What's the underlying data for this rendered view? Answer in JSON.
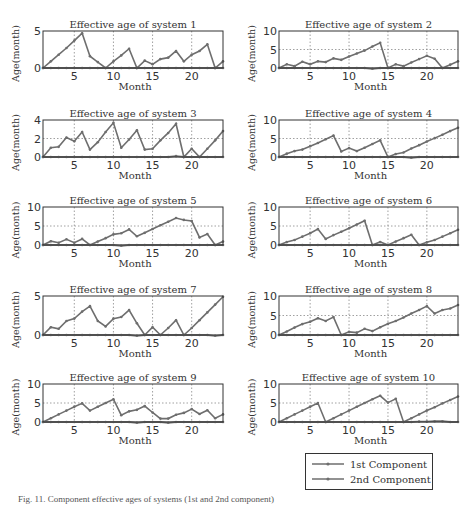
{
  "figure": {
    "caption": "Fig. 11. Component effective ages of systems (1st and 2nd component)"
  },
  "legend": {
    "items": [
      {
        "label": "1st Component",
        "color": "#6e6e6e"
      },
      {
        "label": "2nd Component",
        "color": "#6e6e6e"
      }
    ]
  },
  "chart_data": [
    {
      "type": "line",
      "title": "Effective age of system 1",
      "xlabel": "Month",
      "ylabel": "Age(month)",
      "xlim": [
        1,
        24
      ],
      "ylim": [
        0,
        5
      ],
      "yticks": [
        0,
        5
      ],
      "xticks": [
        5,
        10,
        15,
        20
      ],
      "grid": true,
      "x": [
        1,
        2,
        3,
        4,
        5,
        6,
        7,
        8,
        9,
        10,
        11,
        12,
        13,
        14,
        15,
        16,
        17,
        18,
        19,
        20,
        21,
        22,
        23,
        24
      ],
      "series": [
        {
          "name": "1st Component",
          "values": [
            0,
            0.9,
            1.8,
            2.7,
            3.7,
            4.7,
            1.6,
            0.8,
            0,
            0.9,
            1.7,
            2.6,
            0,
            1.0,
            0.5,
            1.2,
            1.4,
            2.3,
            0.9,
            1.8,
            2.3,
            3.2,
            0,
            0.9
          ]
        },
        {
          "name": "2nd Component",
          "values": [
            0,
            0,
            0,
            0,
            0,
            0,
            0,
            0,
            0,
            0,
            0,
            0,
            0,
            0,
            0,
            0,
            0,
            0,
            0,
            0,
            0,
            0,
            0,
            0
          ]
        }
      ]
    },
    {
      "type": "line",
      "title": "Effective age of system 2",
      "xlabel": "Month",
      "ylabel": "Age(month)",
      "xlim": [
        1,
        24
      ],
      "ylim": [
        0,
        10
      ],
      "yticks": [
        0,
        5,
        10
      ],
      "xticks": [
        5,
        10,
        15,
        20
      ],
      "grid": true,
      "x": [
        1,
        2,
        3,
        4,
        5,
        6,
        7,
        8,
        9,
        10,
        11,
        12,
        13,
        14,
        15,
        16,
        17,
        18,
        19,
        20,
        21,
        22,
        23,
        24
      ],
      "series": [
        {
          "name": "1st Component",
          "values": [
            0,
            1,
            0.5,
            1.7,
            1,
            1.8,
            1.6,
            2.6,
            2.2,
            3.1,
            3.9,
            4.7,
            5.8,
            6.8,
            0,
            1,
            0.5,
            1.5,
            2.4,
            3.3,
            2.5,
            0,
            0.9,
            1.8
          ]
        },
        {
          "name": "2nd Component",
          "values": [
            0,
            0,
            0,
            0,
            0,
            0,
            0,
            0,
            0,
            0,
            0,
            0,
            -0.2,
            0,
            0,
            0,
            0,
            0,
            0,
            0,
            0,
            0,
            0,
            0
          ]
        }
      ]
    },
    {
      "type": "line",
      "title": "Effective age of system 3",
      "xlabel": "Month",
      "ylabel": "Age(month)",
      "xlim": [
        1,
        24
      ],
      "ylim": [
        0,
        4
      ],
      "yticks": [
        0,
        2,
        4
      ],
      "xticks": [
        5,
        10,
        15,
        20
      ],
      "grid": true,
      "x": [
        1,
        2,
        3,
        4,
        5,
        6,
        7,
        8,
        9,
        10,
        11,
        12,
        13,
        14,
        15,
        16,
        17,
        18,
        19,
        20,
        21,
        22,
        23,
        24
      ],
      "series": [
        {
          "name": "1st Component",
          "values": [
            0,
            1.0,
            1.1,
            2.1,
            1.7,
            2.7,
            0.8,
            1.6,
            2.7,
            3.7,
            1.0,
            1.9,
            2.9,
            0.8,
            0.9,
            1.8,
            2.6,
            3.6,
            0,
            0.9,
            0,
            0.9,
            1.8,
            2.8
          ]
        },
        {
          "name": "2nd Component",
          "values": [
            0,
            0,
            0,
            0,
            0,
            0,
            0,
            0,
            0,
            0,
            0,
            0,
            0,
            0,
            0,
            0,
            0,
            0.1,
            0,
            0,
            0,
            0,
            0,
            0
          ]
        }
      ]
    },
    {
      "type": "line",
      "title": "Effective age of system 4",
      "xlabel": "Month",
      "ylabel": "Age(month)",
      "xlim": [
        1,
        24
      ],
      "ylim": [
        0,
        10
      ],
      "yticks": [
        0,
        5,
        10
      ],
      "xticks": [
        5,
        10,
        15,
        20
      ],
      "grid": true,
      "x": [
        1,
        2,
        3,
        4,
        5,
        6,
        7,
        8,
        9,
        10,
        11,
        12,
        13,
        14,
        15,
        16,
        17,
        18,
        19,
        20,
        21,
        22,
        23,
        24
      ],
      "series": [
        {
          "name": "1st Component",
          "values": [
            0,
            0.9,
            1.6,
            2.0,
            2.9,
            3.8,
            4.8,
            5.8,
            1.5,
            2.4,
            1.6,
            2.5,
            3.5,
            4.5,
            0,
            0.8,
            1.2,
            2.3,
            3.2,
            4.2,
            5.1,
            6.0,
            7.0,
            7.9
          ]
        },
        {
          "name": "2nd Component",
          "values": [
            0,
            0,
            0,
            0,
            0,
            0,
            0,
            0,
            0,
            0,
            0,
            0,
            0,
            0,
            0,
            0,
            0,
            -0.2,
            0,
            0,
            0,
            0,
            0,
            0
          ]
        }
      ]
    },
    {
      "type": "line",
      "title": "Effective age of system 5",
      "xlabel": "Month",
      "ylabel": "Age(month)",
      "xlim": [
        1,
        24
      ],
      "ylim": [
        0,
        10
      ],
      "yticks": [
        0,
        5,
        10
      ],
      "xticks": [
        5,
        10,
        15,
        20
      ],
      "grid": true,
      "x": [
        1,
        2,
        3,
        4,
        5,
        6,
        7,
        8,
        9,
        10,
        11,
        12,
        13,
        14,
        15,
        16,
        17,
        18,
        19,
        20,
        21,
        22,
        23,
        24
      ],
      "series": [
        {
          "name": "1st Component",
          "values": [
            0,
            1,
            0.6,
            1.5,
            0.6,
            1.6,
            0,
            0.9,
            1.8,
            2.8,
            3.1,
            4.1,
            2.3,
            3.2,
            4.2,
            5.2,
            6.1,
            7.1,
            6.6,
            6.3,
            2,
            2.9,
            0,
            0.9
          ]
        },
        {
          "name": "2nd Component",
          "values": [
            0,
            0,
            0,
            0,
            0,
            0,
            0,
            0,
            0,
            0,
            -0.2,
            0,
            0,
            0,
            0,
            0,
            0,
            0,
            0,
            0,
            0,
            0,
            0,
            0
          ]
        }
      ]
    },
    {
      "type": "line",
      "title": "Effective age of system 6",
      "xlabel": "Month",
      "ylabel": "Age(month)",
      "xlim": [
        1,
        24
      ],
      "ylim": [
        0,
        10
      ],
      "yticks": [
        0,
        5,
        10
      ],
      "xticks": [
        5,
        10,
        15,
        20
      ],
      "grid": true,
      "x": [
        1,
        2,
        3,
        4,
        5,
        6,
        7,
        8,
        9,
        10,
        11,
        12,
        13,
        14,
        15,
        16,
        17,
        18,
        19,
        20,
        21,
        22,
        23,
        24
      ],
      "series": [
        {
          "name": "1st Component",
          "values": [
            0,
            0.8,
            1.3,
            2.2,
            3.1,
            4.2,
            1.6,
            2.6,
            3.5,
            4.4,
            5.4,
            6.4,
            0,
            0.8,
            0,
            0.9,
            1.8,
            2.7,
            0,
            0.7,
            1.3,
            2.2,
            3.1,
            4.0
          ]
        },
        {
          "name": "2nd Component",
          "values": [
            0,
            0,
            0,
            0,
            0,
            0,
            0,
            0,
            0,
            0,
            0,
            0,
            0,
            0,
            0,
            0,
            0,
            0,
            0,
            0,
            0,
            0,
            0,
            0
          ]
        }
      ]
    },
    {
      "type": "line",
      "title": "Effective age of system 7",
      "xlabel": "Month",
      "ylabel": "Age(month)",
      "xlim": [
        1,
        24
      ],
      "ylim": [
        0,
        5
      ],
      "yticks": [
        0,
        5
      ],
      "xticks": [
        5,
        10,
        15,
        20
      ],
      "grid": true,
      "x": [
        1,
        2,
        3,
        4,
        5,
        6,
        7,
        8,
        9,
        10,
        11,
        12,
        13,
        14,
        15,
        16,
        17,
        18,
        19,
        20,
        21,
        22,
        23,
        24
      ],
      "series": [
        {
          "name": "1st Component",
          "values": [
            0,
            1.0,
            0.8,
            1.8,
            2.1,
            3.0,
            3.7,
            1.8,
            1.1,
            2.1,
            2.3,
            3.2,
            1.5,
            0,
            1.0,
            0,
            0.9,
            1.9,
            0,
            0.9,
            1.9,
            2.9,
            3.9,
            4.9
          ]
        },
        {
          "name": "2nd Component",
          "values": [
            0,
            0,
            0,
            0,
            0,
            0,
            0,
            0,
            0,
            0,
            0,
            0,
            -0.1,
            0,
            0,
            0,
            0,
            0,
            0,
            0,
            0,
            0,
            -0.1,
            0
          ]
        }
      ]
    },
    {
      "type": "line",
      "title": "Effective age of system 8",
      "xlabel": "Month",
      "ylabel": "Age(month)",
      "xlim": [
        1,
        24
      ],
      "ylim": [
        0,
        10
      ],
      "yticks": [
        0,
        5,
        10
      ],
      "xticks": [
        5,
        10,
        15,
        20
      ],
      "grid": true,
      "x": [
        1,
        2,
        3,
        4,
        5,
        6,
        7,
        8,
        9,
        10,
        11,
        12,
        13,
        14,
        15,
        16,
        17,
        18,
        19,
        20,
        21,
        22,
        23,
        24
      ],
      "series": [
        {
          "name": "1st Component",
          "values": [
            0,
            0.9,
            1.9,
            2.8,
            3.4,
            4.3,
            3.6,
            4.6,
            0,
            0.8,
            0.6,
            1.6,
            1.0,
            2.0,
            2.9,
            3.6,
            4.5,
            5.5,
            6.4,
            7.4,
            5.5,
            6.4,
            6.8,
            7.7
          ]
        },
        {
          "name": "2nd Component",
          "values": [
            0,
            0,
            0,
            0,
            0,
            0,
            0,
            0,
            0,
            0,
            0,
            0,
            0,
            0,
            0,
            0,
            0,
            0,
            0,
            0,
            0,
            0,
            0,
            0
          ]
        }
      ]
    },
    {
      "type": "line",
      "title": "Effective age of system 9",
      "xlabel": "Month",
      "ylabel": "Age(month)",
      "xlim": [
        1,
        24
      ],
      "ylim": [
        0,
        10
      ],
      "yticks": [
        0,
        5,
        10
      ],
      "xticks": [
        5,
        10,
        15,
        20
      ],
      "grid": true,
      "x": [
        1,
        2,
        3,
        4,
        5,
        6,
        7,
        8,
        9,
        10,
        11,
        12,
        13,
        14,
        15,
        16,
        17,
        18,
        19,
        20,
        21,
        22,
        23,
        24
      ],
      "series": [
        {
          "name": "1st Component",
          "values": [
            0,
            1,
            2,
            3,
            4,
            4.9,
            3,
            4,
            5,
            6,
            1.8,
            2.8,
            3.2,
            4.2,
            2.5,
            0.9,
            0.9,
            1.9,
            2.4,
            3.4,
            2.1,
            3.1,
            1.0,
            2.0
          ]
        },
        {
          "name": "2nd Component",
          "values": [
            0,
            0,
            0,
            0,
            0,
            0,
            0,
            0,
            0,
            0,
            0,
            0,
            -0.2,
            0,
            0,
            0,
            -0.2,
            0,
            0,
            0,
            0,
            0,
            0,
            0
          ]
        }
      ]
    },
    {
      "type": "line",
      "title": "Effective age of system 10",
      "xlabel": "Month",
      "ylabel": "Age(month)",
      "xlim": [
        1,
        24
      ],
      "ylim": [
        0,
        10
      ],
      "yticks": [
        0,
        5,
        10
      ],
      "xticks": [
        5,
        10,
        15,
        20
      ],
      "grid": true,
      "x": [
        1,
        2,
        3,
        4,
        5,
        6,
        7,
        8,
        9,
        10,
        11,
        12,
        13,
        14,
        15,
        16,
        17,
        18,
        19,
        20,
        21,
        22,
        23,
        24
      ],
      "series": [
        {
          "name": "1st Component",
          "values": [
            0,
            1,
            2,
            3,
            4,
            5,
            0,
            1,
            2,
            3,
            4,
            5,
            6,
            6.9,
            5.1,
            6.1,
            0,
            1,
            2,
            3,
            3.9,
            4.9,
            5.8,
            6.7
          ]
        },
        {
          "name": "2nd Component",
          "values": [
            0,
            0,
            0,
            0,
            0,
            0,
            0,
            0,
            0,
            0,
            0,
            0,
            0,
            0,
            0,
            0,
            0,
            0,
            0.1,
            0.1,
            0.2,
            0.2,
            0,
            0
          ]
        }
      ]
    }
  ],
  "layout": {
    "panels": [
      {
        "x": 43,
        "y": 31,
        "w": 180,
        "h": 37
      },
      {
        "x": 279,
        "y": 31,
        "w": 179,
        "h": 37
      },
      {
        "x": 43,
        "y": 120,
        "w": 180,
        "h": 37
      },
      {
        "x": 279,
        "y": 120,
        "w": 179,
        "h": 37
      },
      {
        "x": 43,
        "y": 207,
        "w": 180,
        "h": 38
      },
      {
        "x": 279,
        "y": 207,
        "w": 179,
        "h": 38
      },
      {
        "x": 43,
        "y": 296,
        "w": 180,
        "h": 39
      },
      {
        "x": 279,
        "y": 296,
        "w": 179,
        "h": 39
      },
      {
        "x": 43,
        "y": 384,
        "w": 180,
        "h": 38
      },
      {
        "x": 279,
        "y": 384,
        "w": 179,
        "h": 38
      }
    ],
    "line_color": "#6e6e6e",
    "grid_color": "#888888",
    "axis_color": "#333333"
  }
}
